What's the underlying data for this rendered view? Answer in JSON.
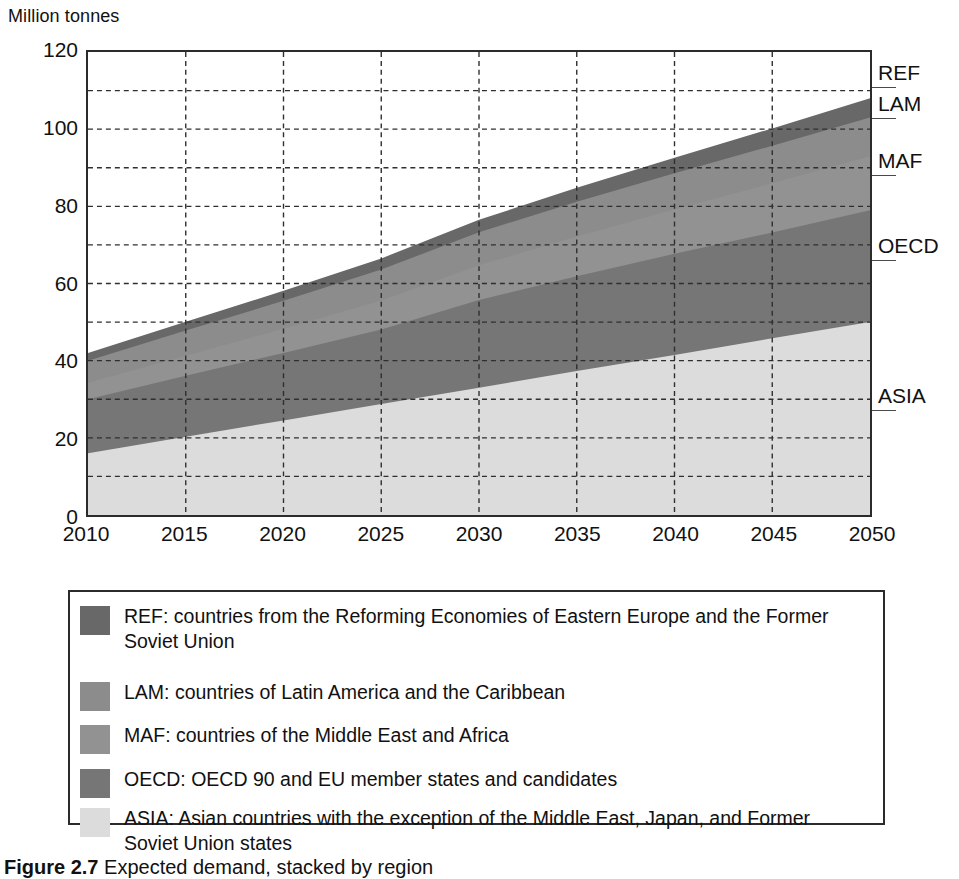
{
  "axis": {
    "y_unit_label": "Million tonnes",
    "y_ticks": [
      0,
      20,
      40,
      60,
      80,
      100,
      120
    ],
    "y_minor_ticks": [
      10,
      30,
      50,
      70,
      90,
      110
    ],
    "x_ticks": [
      2010,
      2015,
      2020,
      2025,
      2030,
      2035,
      2040,
      2045,
      2050
    ]
  },
  "callouts": [
    {
      "key": "REF",
      "label": "REF"
    },
    {
      "key": "LAM",
      "label": "LAM"
    },
    {
      "key": "MAF",
      "label": "MAF"
    },
    {
      "key": "OECD",
      "label": "OECD"
    },
    {
      "key": "ASIA",
      "label": "ASIA"
    }
  ],
  "legend": {
    "items": [
      {
        "key": "REF",
        "color": "#686868",
        "text": "REF: countries from the Reforming Economies of Eastern Europe and the Former Soviet Union"
      },
      {
        "key": "LAM",
        "color": "#8c8c8c",
        "text": "LAM: countries of Latin America and the Caribbean"
      },
      {
        "key": "MAF",
        "color": "#929292",
        "text": "MAF: countries of the Middle East and Africa"
      },
      {
        "key": "OECD",
        "color": "#767676",
        "text": "OECD: OECD 90 and EU member states and candidates"
      },
      {
        "key": "ASIA",
        "color": "#dcdcdc",
        "text": "ASIA: Asian countries with the exception of the Middle East, Japan, and Former Soviet Union states"
      }
    ]
  },
  "caption": {
    "number": "Figure 2.7",
    "rest": "Expected demand, stacked by region"
  },
  "chart_data": {
    "type": "area",
    "title": "",
    "xlabel": "",
    "ylabel": "Million tonnes",
    "xlim": [
      2010,
      2050
    ],
    "ylim": [
      0,
      120
    ],
    "grid": true,
    "stacked": true,
    "legend_position": "below-chart",
    "x": [
      2010,
      2015,
      2020,
      2025,
      2030,
      2035,
      2040,
      2045,
      2050
    ],
    "series": [
      {
        "name": "ASIA",
        "color": "#dcdcdc",
        "values": [
          16.0,
          20.3,
          24.5,
          28.8,
          33.0,
          37.3,
          41.5,
          45.8,
          50.0
        ]
      },
      {
        "name": "OECD",
        "color": "#767676",
        "values": [
          14.0,
          15.8,
          17.5,
          19.3,
          22.7,
          24.6,
          26.2,
          27.4,
          29.0
        ]
      },
      {
        "name": "MAF",
        "color": "#929292",
        "values": [
          4.3,
          5.2,
          6.3,
          7.5,
          9.0,
          10.3,
          11.5,
          12.8,
          14.0
        ]
      },
      {
        "name": "LAM",
        "color": "#8c8c8c",
        "values": [
          5.7,
          6.5,
          7.2,
          8.0,
          8.6,
          9.0,
          9.4,
          9.7,
          10.0
        ]
      },
      {
        "name": "REF",
        "color": "#686868",
        "values": [
          2.0,
          2.3,
          2.6,
          2.9,
          3.2,
          3.6,
          4.0,
          4.5,
          5.0
        ]
      }
    ],
    "cumulative_tops": {
      "ASIA": [
        16.0,
        20.3,
        24.5,
        28.8,
        33.0,
        37.3,
        41.5,
        45.8,
        50.0
      ],
      "OECD": [
        30.0,
        36.1,
        42.0,
        48.1,
        55.7,
        61.9,
        67.7,
        73.2,
        79.0
      ],
      "MAF": [
        34.3,
        41.3,
        48.3,
        55.6,
        64.7,
        72.2,
        79.2,
        86.0,
        93.0
      ],
      "LAM": [
        40.0,
        47.8,
        55.5,
        63.6,
        73.3,
        81.2,
        88.6,
        95.7,
        103.0
      ],
      "REF": [
        42.0,
        50.1,
        58.1,
        66.5,
        76.5,
        84.8,
        92.6,
        100.2,
        108.0
      ]
    },
    "callout_values": {
      "REF": 110.5,
      "LAM": 102.5,
      "MAF": 88.0,
      "OECD": 66.0,
      "ASIA": 27.5
    }
  }
}
